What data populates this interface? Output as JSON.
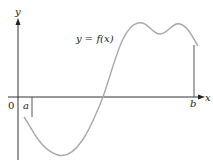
{
  "figure": {
    "type": "function-graph",
    "axis_labels": {
      "x": "x",
      "y": "y"
    },
    "origin_label": "0",
    "interval_labels": {
      "a": "a",
      "b": "b"
    },
    "curve_label": "y = f(x)",
    "colors": {
      "axes": "#333333",
      "curve": "#a8a8a8",
      "boundary_lines": "#555555",
      "text": "#222222"
    }
  }
}
